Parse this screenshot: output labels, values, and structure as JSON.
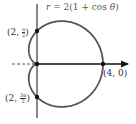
{
  "figure": {
    "equation": "r = 2(1 + cos θ)",
    "curve_type": "cardioid",
    "points": [
      {
        "label_prefix": "(2, ",
        "num": "π",
        "den": "2",
        "label_suffix": ")",
        "r": 2,
        "theta": "π/2"
      },
      {
        "label_prefix": "(2, ",
        "num": "3π",
        "den": "2",
        "label_suffix": ")",
        "r": 2,
        "theta": "3π/2"
      },
      {
        "label": "(4, 0)",
        "r": 4,
        "theta": "0"
      }
    ],
    "colors": {
      "curve": "#555555",
      "axes": "#111111",
      "points": "#111111"
    }
  }
}
